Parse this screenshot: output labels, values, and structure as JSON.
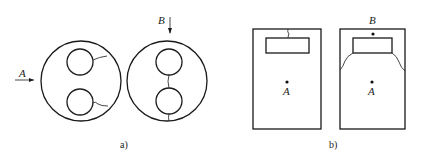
{
  "figure_a": {
    "caption": "a)",
    "left_view": {
      "arrow_label": "A"
    },
    "right_view": {
      "arrow_label": "B"
    }
  },
  "figure_b": {
    "caption": "b)",
    "left_view": {
      "point_label": "A"
    },
    "right_view": {
      "top_point_label": "B",
      "center_point_label": "A"
    }
  },
  "colors": {
    "line": "#1a1a1a",
    "background": "#ffffff"
  }
}
